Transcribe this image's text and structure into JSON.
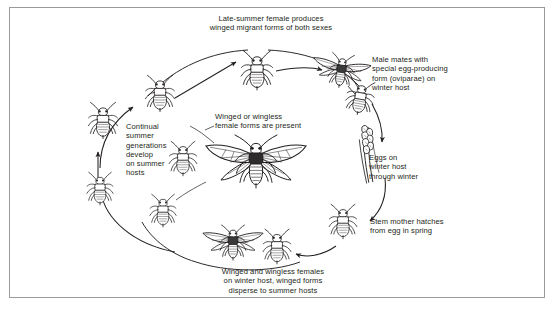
{
  "figure": {
    "background_color": "#ffffff",
    "border_color": "#9a9a9a",
    "ink_color": "#231f20",
    "width": 555,
    "height": 310
  },
  "labels": {
    "late_summer": "Late-summer female produces\nwinged migrant forms of both sexes",
    "male_mates": "Male mates with\n special egg-producing\n form (oviparae) on\n winter host",
    "eggs_winter": "Eggs on\nwinter host\nthrough winter",
    "stem_mother": "Stem mother hatches\nfrom egg in spring",
    "winged_wingless_bottom": "Winged and wingless females\non winter host, winged forms\ndisperse to summer hosts",
    "continual_summer": "Continual\nsummer\ngenerations\ndevelop\non summer\nhosts",
    "winged_or_wingless": "Winged or wingless\nfemale forms are present"
  },
  "organisms": [
    {
      "id": "top-wingless-female",
      "name": "wingless-aphid",
      "form": "wingless",
      "x": 256,
      "y": 72
    },
    {
      "id": "winged-male",
      "name": "winged-male-aphid",
      "form": "winged",
      "x": 341,
      "y": 73
    },
    {
      "id": "oviparae-female",
      "name": "oviparae-female-aphid",
      "form": "wingless",
      "x": 359,
      "y": 99
    },
    {
      "id": "eggs-on-stem",
      "name": "eggs-on-stem",
      "form": "eggs",
      "x": 364,
      "y": 155
    },
    {
      "id": "stem-mother",
      "name": "stem-mother-aphid",
      "form": "wingless",
      "x": 343,
      "y": 223
    },
    {
      "id": "bottom-winged-female",
      "name": "winged-female-aphid",
      "form": "winged",
      "x": 233,
      "y": 244
    },
    {
      "id": "bottom-wingless-female",
      "name": "wingless-aphid",
      "form": "wingless",
      "x": 277,
      "y": 248
    },
    {
      "id": "summer-wingless-upper",
      "name": "wingless-aphid",
      "form": "wingless",
      "x": 103,
      "y": 122
    },
    {
      "id": "summer-wingless-lower",
      "name": "wingless-aphid",
      "form": "wingless",
      "x": 100,
      "y": 190
    },
    {
      "id": "summer-winged-migrant",
      "name": "winged-aphid",
      "form": "winged",
      "x": 160,
      "y": 95
    },
    {
      "id": "summer-pair-left",
      "name": "wingless-aphid",
      "form": "wingless",
      "x": 181,
      "y": 160
    },
    {
      "id": "summer-pair-right",
      "name": "wingless-aphid",
      "form": "wingless",
      "x": 163,
      "y": 212
    },
    {
      "id": "central-winged-female",
      "name": "central-winged-aphid",
      "form": "winged",
      "x": 256,
      "y": 165
    }
  ],
  "flow": {
    "direction": "clockwise",
    "steps": [
      "summer generations on summer hosts",
      "late-summer female produces winged migrants",
      "male mates with oviparae on winter host",
      "eggs overwinter on winter host",
      "stem mother hatches in spring",
      "winged and wingless females disperse to summer hosts"
    ]
  }
}
